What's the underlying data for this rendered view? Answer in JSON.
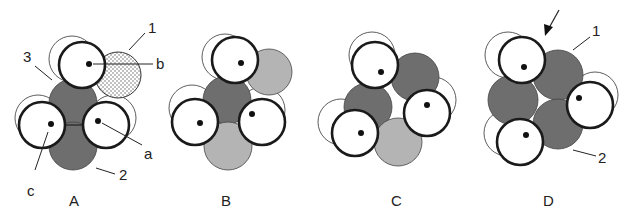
{
  "figure": {
    "panels": [
      {
        "id": "A",
        "label": "A"
      },
      {
        "id": "B",
        "label": "B"
      },
      {
        "id": "C",
        "label": "C"
      },
      {
        "id": "D",
        "label": "D"
      }
    ],
    "annotations": {
      "A": {
        "label_1": "1",
        "label_2": "2",
        "label_3": "3",
        "label_a": "a",
        "label_b": "b",
        "label_c": "c"
      },
      "D": {
        "label_1": "1",
        "label_2": "2"
      }
    },
    "colors": {
      "dark_fill": "#6e6e6e",
      "light_fill": "#b4b4b4",
      "white_fill": "#ffffff",
      "stroke": "#1a1a1a"
    }
  }
}
